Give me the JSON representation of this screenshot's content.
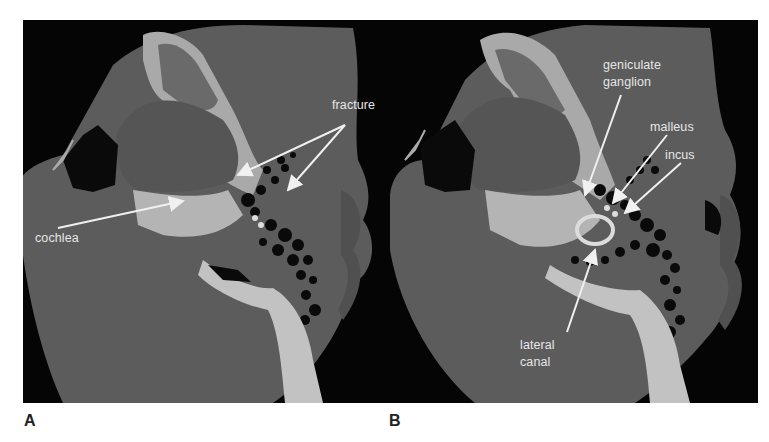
{
  "figure": {
    "panels": [
      {
        "id": "A",
        "letter": "A",
        "labels": {
          "fracture": "fracture",
          "cochlea": "cochlea"
        }
      },
      {
        "id": "B",
        "letter": "B",
        "labels": {
          "geniculate_line1": "geniculate",
          "geniculate_line2": "ganglion",
          "malleus": "malleus",
          "incus": "incus",
          "lateral_line1": "lateral",
          "lateral_line2": "canal"
        }
      }
    ],
    "colors": {
      "background": "#050505",
      "soft_tissue": "#5a5a5a",
      "bone": "#c8c8c8",
      "air": "#0a0a0a",
      "annotation": "#f0f0f0"
    }
  }
}
